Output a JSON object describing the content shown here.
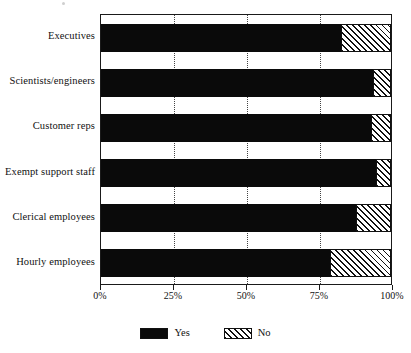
{
  "chart_data": {
    "type": "bar",
    "orientation": "horizontal",
    "stacked": true,
    "stacked_percent": true,
    "title": "",
    "subtitle": "",
    "xlabel": "",
    "ylabel": "",
    "xlim": [
      0,
      100
    ],
    "xticks": [
      0,
      25,
      50,
      75,
      100
    ],
    "xtick_labels": [
      "0%",
      "25%",
      "50%",
      "75%",
      "100%"
    ],
    "grid": "vertical-dotted",
    "legend_position": "bottom-center",
    "categories": [
      "Executives",
      "Scientists/engineers",
      "Customer reps",
      "Exempt support staff",
      "Clerical employees",
      "Hourly employees"
    ],
    "series": [
      {
        "name": "Yes",
        "color": "#0a0a0a",
        "fill": "solid-black",
        "values": [
          83,
          94,
          93,
          95,
          88,
          79
        ]
      },
      {
        "name": "No",
        "color": "#111111",
        "fill": "diagonal-hatch",
        "values": [
          17,
          6,
          7,
          5,
          12,
          21
        ]
      }
    ],
    "annotations": []
  },
  "legend": {
    "items": [
      {
        "label": "Yes",
        "swatch": "solid-black-swatch"
      },
      {
        "label": "No",
        "swatch": "hatched-swatch"
      }
    ]
  }
}
